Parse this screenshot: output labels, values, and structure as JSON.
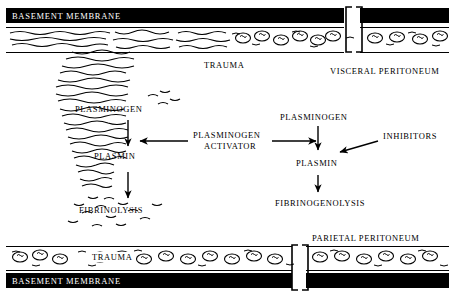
{
  "figure": {
    "title_top_membrane": "BASEMENT MEMBRANE",
    "title_bottom_membrane": "BASEMENT MEMBRANE",
    "labels": {
      "trauma_top": "TRAUMA",
      "visceral_peritoneum": "VISCERAL PERITONEUM",
      "plasminogen_left": "PLASMINOGEN",
      "plasmin_left": "PLASMIN",
      "fibrinolysis": "FIBRINOLYSIS",
      "plasminogen_activator": "PLASMINOGEN\nACTIVATOR",
      "plasminogen_activator_line1": "PLASMINOGEN",
      "plasminogen_activator_line2": "ACTIVATOR",
      "plasminogen_right": "PLASMINOGEN",
      "inhibitors": "INHIBITORS",
      "plasmin_right": "PLASMIN",
      "fibrinogenolysis": "FIBRINOGENOLYSIS",
      "parietal_peritoneum": "PARIETAL PERITONEUM",
      "trauma_bottom": "TRAUMA"
    },
    "colors": {
      "ink": "#000000",
      "paper": "#ffffff",
      "band_fill": "#000000",
      "band_text": "#ffffff"
    }
  }
}
